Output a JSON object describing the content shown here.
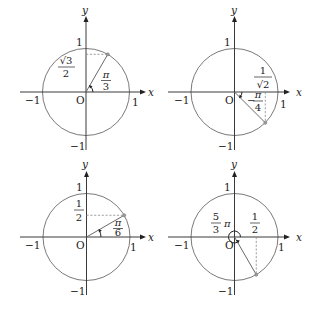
{
  "diagrams": [
    {
      "id": "top-left",
      "axis_x_label": "x",
      "axis_y_label": "y",
      "origin_label": "O",
      "ticks": {
        "pos_x": "1",
        "neg_x": "−1",
        "pos_y": "1",
        "neg_y": "−1"
      },
      "angle": {
        "num": "π",
        "den": "3"
      },
      "projection": {
        "num": "√3",
        "den": "2",
        "axis": "y"
      }
    },
    {
      "id": "top-right",
      "axis_x_label": "x",
      "axis_y_label": "y",
      "origin_label": "O",
      "ticks": {
        "pos_x": "1",
        "neg_x": "−1",
        "pos_y": "1",
        "neg_y": "−1"
      },
      "angle": {
        "sign": "−",
        "num": "π",
        "den": "4"
      },
      "projection": {
        "num": "1",
        "den": "√2",
        "axis": "x"
      }
    },
    {
      "id": "bottom-left",
      "axis_x_label": "x",
      "axis_y_label": "y",
      "origin_label": "O",
      "ticks": {
        "pos_x": "1",
        "neg_x": "−1",
        "pos_y": "1",
        "neg_y": "−1"
      },
      "angle": {
        "num": "π",
        "den": "6"
      },
      "projection": {
        "num": "1",
        "den": "2",
        "axis": "y"
      }
    },
    {
      "id": "bottom-right",
      "axis_x_label": "x",
      "axis_y_label": "y",
      "origin_label": "O",
      "ticks": {
        "pos_x": "1",
        "neg_x": "−1",
        "pos_y": "1",
        "neg_y": "−1"
      },
      "angle": {
        "num": "5",
        "den": "3",
        "suffix": "π"
      },
      "projection": {
        "num": "1",
        "den": "2",
        "axis": "x"
      }
    }
  ],
  "colors": {
    "axis": "#3a3a3a",
    "circle": "#6a6a6a",
    "dashed": "#8a8a8a",
    "point": "#9a9a9a"
  }
}
